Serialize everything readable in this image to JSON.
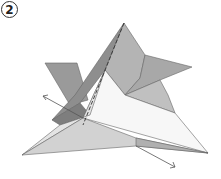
{
  "diagram": {
    "type": "origami-instruction",
    "step_number": "2",
    "annotations": [
      {
        "kind": "arrow",
        "direction": "up-left",
        "meaning": "pull flap outward"
      },
      {
        "kind": "arrow",
        "direction": "down-right",
        "meaning": "pull flap outward"
      }
    ],
    "colors": {
      "paper_dark": "#8e8e8e",
      "paper_mid": "#b4b4b4",
      "paper_light": "#d6d6d6",
      "paper_white": "#f7f7f7",
      "line": "#555555"
    }
  }
}
